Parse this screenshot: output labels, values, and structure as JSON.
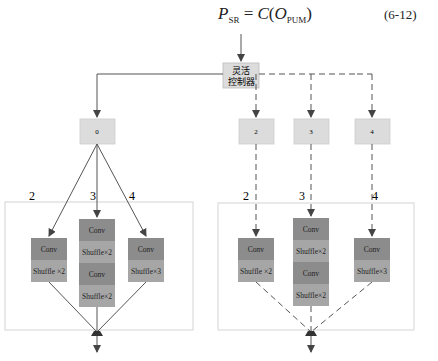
{
  "formula": {
    "lhs": "P",
    "lhs_sub": "SR",
    "equals": "=",
    "func": "C",
    "arg": "O",
    "arg_sub": "PUM",
    "number": "(6-12)"
  },
  "controller": {
    "line1": "灵活",
    "line2": "控制器"
  },
  "left": {
    "branch_node": "0",
    "edge_labels": [
      "2",
      "3",
      "4"
    ],
    "blocks": [
      {
        "rows": [
          "Conv",
          "Shuffle ×2"
        ]
      },
      {
        "rows": [
          "Conv",
          "Shuffle×2",
          "Conv",
          "Shuffle×2"
        ]
      },
      {
        "rows": [
          "Conv",
          "Shuffle×3"
        ]
      }
    ]
  },
  "right": {
    "branch_nodes": [
      "2",
      "3",
      "4"
    ],
    "edge_labels": [
      "2",
      "3",
      "4"
    ],
    "blocks": [
      {
        "rows": [
          "Conv",
          "Shuffle ×2"
        ]
      },
      {
        "rows": [
          "Conv",
          "Shuffle×2",
          "Conv",
          "Shuffle×2"
        ]
      },
      {
        "rows": [
          "Conv",
          "Shuffle×3"
        ]
      }
    ]
  },
  "colors": {
    "node_fill": "#dcdcdc",
    "conv_fill": "#8c8c8c",
    "shuffle_fill": "#a6a6a6",
    "line": "#555555",
    "frame": "#d4d4d4"
  }
}
